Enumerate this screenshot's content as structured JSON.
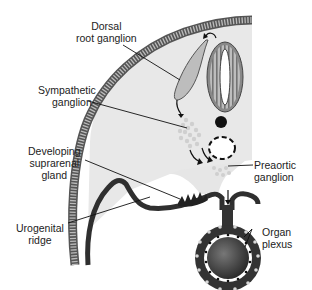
{
  "labels": {
    "dorsal_root_ganglion": [
      "Dorsal",
      "root ganglion"
    ],
    "sympathetic_ganglion": [
      "Sympathetic",
      "ganglion"
    ],
    "developing_suprarenal_gland": [
      "Developing",
      "suprarenal",
      "gland"
    ],
    "urogenital_ridge": [
      "Urogenital",
      "ridge"
    ],
    "preaortic_ganglion": [
      "Preaortic",
      "ganglion"
    ],
    "organ_plexus": [
      "Organ",
      "plexus"
    ]
  },
  "colors": {
    "tissue_fill": "#e8e8e8",
    "ectoderm_stripe": "#8a8a8a",
    "dark_outline": "#333333",
    "ganglion_fill": "#bdbdbd",
    "neural_tube": "#888888",
    "cells": "#cfcfcf"
  }
}
